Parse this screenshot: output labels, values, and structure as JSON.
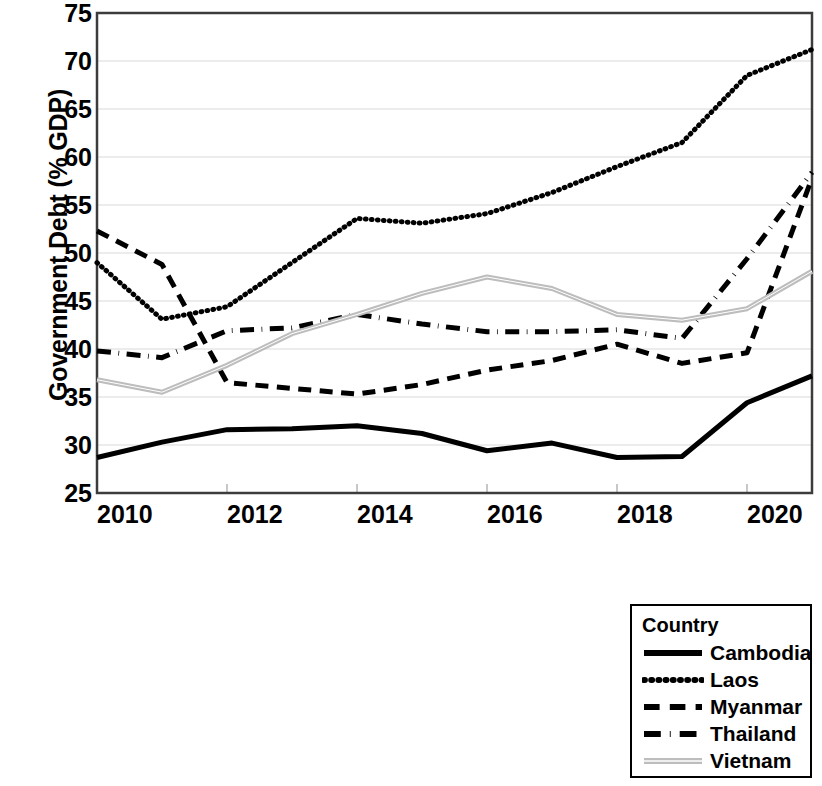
{
  "chart_data": {
    "type": "line",
    "title": "",
    "xlabel": "",
    "ylabel": "Government Debt (% GDP)",
    "x": [
      2010,
      2011,
      2012,
      2013,
      2014,
      2015,
      2016,
      2017,
      2018,
      2019,
      2020,
      2021
    ],
    "xtick_labels": [
      "2010",
      "2012",
      "2014",
      "2016",
      "2018",
      "2020"
    ],
    "xticks": [
      2010,
      2012,
      2014,
      2016,
      2018,
      2020
    ],
    "ytick_labels": [
      "25",
      "30",
      "35",
      "40",
      "45",
      "50",
      "55",
      "60",
      "65",
      "70",
      "75"
    ],
    "yticks": [
      25,
      30,
      35,
      40,
      45,
      50,
      55,
      60,
      65,
      70,
      75
    ],
    "xlim": [
      2010,
      2021
    ],
    "ylim": [
      25,
      75
    ],
    "grid": "horizontal",
    "legend_position": "below-right",
    "legend_title": "Country",
    "series": [
      {
        "name": "Cambodia",
        "style": "solid",
        "color": "#000000",
        "width": 5,
        "values": [
          28.7,
          30.3,
          31.6,
          31.7,
          32.0,
          31.2,
          29.4,
          30.2,
          28.7,
          28.8,
          34.4,
          37.2
        ]
      },
      {
        "name": "Laos",
        "style": "dotted",
        "color": "#000000",
        "width": 5,
        "values": [
          49.0,
          43.1,
          44.4,
          49.0,
          53.6,
          53.1,
          54.1,
          56.3,
          59.0,
          61.5,
          68.5,
          71.2
        ]
      },
      {
        "name": "Myanmar",
        "style": "dashed",
        "color": "#000000",
        "width": 5,
        "values": [
          52.3,
          48.8,
          36.5,
          35.9,
          35.3,
          36.3,
          37.8,
          38.8,
          40.5,
          38.5,
          39.6,
          57.8
        ]
      },
      {
        "name": "Thailand",
        "style": "dashdot",
        "color": "#000000",
        "width": 5,
        "values": [
          39.8,
          39.1,
          41.9,
          42.2,
          43.6,
          42.6,
          41.8,
          41.8,
          42.0,
          41.1,
          49.4,
          58.4
        ]
      },
      {
        "name": "Vietnam",
        "style": "thin-double",
        "color": "#bdbdbd",
        "width": 3,
        "values": [
          36.8,
          35.5,
          38.3,
          41.6,
          43.6,
          45.8,
          47.5,
          46.3,
          43.6,
          43.0,
          44.2,
          48.1
        ]
      }
    ]
  },
  "legend": {
    "title": "Country",
    "items": [
      {
        "label": "Cambodia",
        "swatch": "line-solid-swatch"
      },
      {
        "label": "Laos",
        "swatch": "line-dotted-swatch"
      },
      {
        "label": "Myanmar",
        "swatch": "line-dashed-swatch"
      },
      {
        "label": "Thailand",
        "swatch": "line-dashdot-swatch"
      },
      {
        "label": "Vietnam",
        "swatch": "line-thin-swatch"
      }
    ]
  },
  "axes": {
    "y_title": "Government Debt (% GDP)",
    "y_ticks": [
      "75",
      "70",
      "65",
      "60",
      "55",
      "50",
      "45",
      "40",
      "35",
      "30",
      "25"
    ],
    "x_ticks": [
      "2010",
      "2012",
      "2014",
      "2016",
      "2018",
      "2020"
    ]
  },
  "colors": {
    "ink": "#000000",
    "grid": "#d9d9d9",
    "frame": "#404040",
    "vietnam": "#bdbdbd",
    "background": "#ffffff"
  }
}
